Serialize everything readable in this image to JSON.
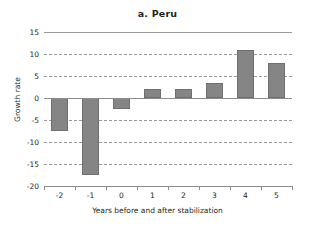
{
  "chart_data": {
    "type": "bar",
    "title": "a. Peru",
    "xlabel": "Years before and after stabilization",
    "ylabel": "Growth rate",
    "categories": [
      "-2",
      "-1",
      "0",
      "1",
      "2",
      "3",
      "4",
      "5"
    ],
    "values": [
      -7.5,
      -17.5,
      -2.5,
      2,
      2,
      3.5,
      11,
      8
    ],
    "series": [
      {
        "name": "Growth rate",
        "values": [
          -7.5,
          -17.5,
          -2.5,
          2,
          2,
          3.5,
          11,
          8
        ]
      }
    ],
    "ylim": [
      -20,
      15
    ],
    "yticks": [
      15,
      10,
      5,
      0,
      -5,
      -10,
      -15,
      -20
    ],
    "ytick_labels": [
      "15",
      "10",
      "5",
      "0",
      "-5",
      "-10",
      "-15",
      "-20"
    ],
    "grid": true,
    "grid_style": "dashed-horizontal",
    "legend": null,
    "bar_color": "#858585",
    "grid_color": "#9a9a9a",
    "axis_color": "#8c8c8c",
    "text_color": "#231f20"
  }
}
